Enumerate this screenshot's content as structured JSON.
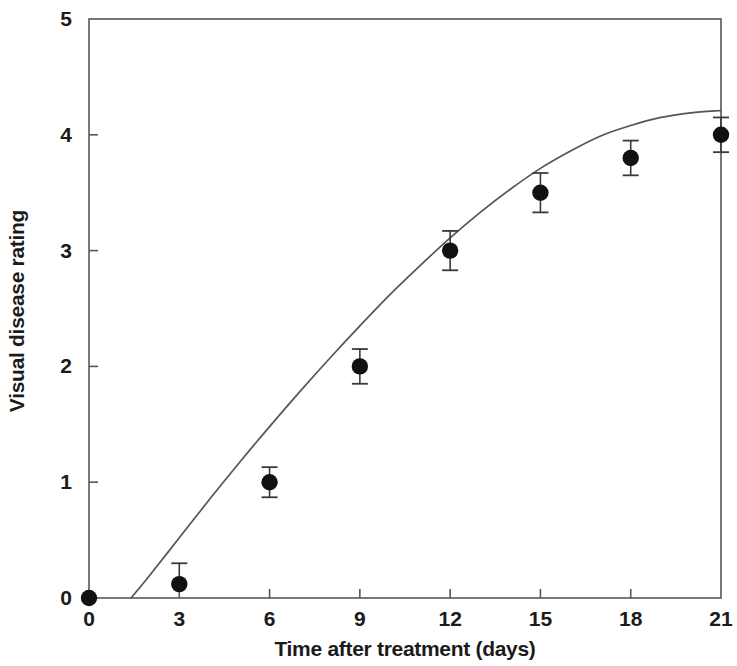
{
  "chart_data": {
    "type": "scatter",
    "title": "",
    "subtitle": "",
    "xlabel": "Time after treatment (days)",
    "ylabel": "Visual disease rating",
    "xlim": [
      0,
      21
    ],
    "ylim": [
      0,
      5
    ],
    "xticks": [
      0,
      3,
      6,
      9,
      12,
      15,
      18,
      21
    ],
    "yticks": [
      0,
      1,
      2,
      3,
      4,
      5
    ],
    "xtick_labels": [
      "0",
      "3",
      "6",
      "9",
      "12",
      "15",
      "18",
      "21"
    ],
    "ytick_labels": [
      "0",
      "1",
      "2",
      "3",
      "4",
      "5"
    ],
    "grid": false,
    "legend": null,
    "marker": "filled-circle",
    "marker_color": "#111111",
    "line_color": "#555555",
    "frame": true,
    "tick_direction": "in",
    "x": [
      0,
      3,
      6,
      9,
      12,
      15,
      18,
      21
    ],
    "values": [
      0.0,
      0.12,
      1.0,
      2.0,
      3.0,
      3.5,
      3.8,
      4.0
    ],
    "error_low": [
      0.0,
      0.0,
      0.13,
      0.15,
      0.17,
      0.17,
      0.15,
      0.15
    ],
    "error_high": [
      0.0,
      0.18,
      0.13,
      0.15,
      0.17,
      0.17,
      0.15,
      0.15
    ],
    "series": [
      {
        "name": "Visual disease rating",
        "x": [
          0,
          3,
          6,
          9,
          12,
          15,
          18,
          21
        ],
        "values": [
          0.0,
          0.12,
          1.0,
          2.0,
          3.0,
          3.5,
          3.8,
          4.0
        ],
        "error_low": [
          0.0,
          0.0,
          0.13,
          0.15,
          0.17,
          0.17,
          0.15,
          0.15
        ],
        "error_high": [
          0.0,
          0.18,
          0.13,
          0.15,
          0.17,
          0.17,
          0.15,
          0.15
        ]
      }
    ],
    "fitted_curve": {
      "name": "fitted growth curve",
      "x": [
        1.4,
        2.0,
        3.0,
        4.0,
        5.0,
        6.0,
        7.0,
        8.0,
        9.0,
        10.0,
        11.0,
        12.0,
        13.0,
        14.0,
        15.0,
        16.0,
        17.0,
        18.0,
        19.0,
        20.0,
        21.0
      ],
      "values": [
        0.0,
        0.19,
        0.52,
        0.85,
        1.17,
        1.48,
        1.78,
        2.07,
        2.35,
        2.62,
        2.87,
        3.11,
        3.33,
        3.53,
        3.71,
        3.86,
        3.99,
        4.08,
        4.15,
        4.19,
        4.21
      ]
    }
  }
}
